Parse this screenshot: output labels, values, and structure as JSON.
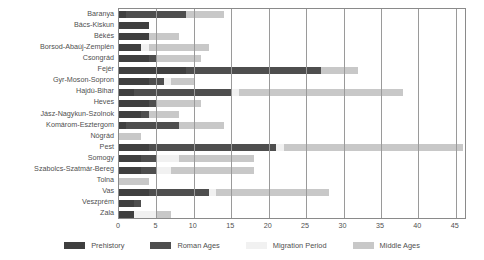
{
  "chart_data": {
    "type": "bar",
    "subtype": "stacked-horizontal-bar",
    "title": "",
    "xlabel": "",
    "ylabel": "",
    "xlim": [
      0,
      46.5
    ],
    "ylim": null,
    "grid": true,
    "grid_axis": "x",
    "legend_position": "bottom",
    "xticks": [
      0,
      5,
      10,
      15,
      20,
      25,
      30,
      35,
      40,
      45
    ],
    "categories": [
      "Baranya",
      "Bács-Kiskun",
      "Békés",
      "Borsod-Abaúj-Zemplén",
      "Csongrád",
      "Fejér",
      "Gyr-Moson-Sopron",
      "Hajdú-Bihar",
      "Heves",
      "Jász-Nagykun-Szolnok",
      "Komárom-Esztergom",
      "Nógrád",
      "Pest",
      "Somogy",
      "Szabolcs-Szatmár-Bereg",
      "Tolna",
      "Vas",
      "Veszprém",
      "Zala"
    ],
    "series": [
      {
        "name": "Prehistory",
        "color": "#3f3f3f",
        "values": [
          1,
          4,
          4,
          3,
          4,
          9,
          4,
          2,
          4,
          3,
          1,
          0,
          4,
          3,
          3,
          0,
          4,
          2,
          2
        ]
      },
      {
        "name": "Roman Ages",
        "color": "#4e4e4e",
        "values": [
          8,
          0,
          0,
          0,
          1,
          18,
          2,
          13,
          1,
          1,
          7,
          0,
          17,
          2,
          2,
          0,
          8,
          1,
          0
        ]
      },
      {
        "name": "Migration Period",
        "color": "#f1f1f1",
        "values": [
          0,
          0,
          0,
          1,
          0,
          0,
          1,
          1,
          0,
          0,
          0,
          0,
          1,
          3,
          2,
          0,
          1,
          0,
          3
        ]
      },
      {
        "name": "Middle Ages",
        "color": "#c8c8c8",
        "values": [
          5,
          0,
          4,
          8,
          6,
          5,
          3,
          22,
          6,
          4,
          6,
          3,
          24,
          10,
          11,
          4,
          15,
          0,
          2
        ]
      }
    ],
    "totals": [
      14,
      4,
      8,
      12,
      11,
      32,
      10,
      38,
      11,
      8,
      14,
      3,
      46,
      18,
      18,
      4,
      28,
      3,
      7
    ]
  },
  "legend": {
    "items": [
      {
        "label": "Prehistory",
        "color": "#3f3f3f"
      },
      {
        "label": "Roman Ages",
        "color": "#4e4e4e"
      },
      {
        "label": "Migration Period",
        "color": "#f1f1f1"
      },
      {
        "label": "Middle Ages",
        "color": "#c8c8c8"
      }
    ]
  },
  "colors": {
    "grid": "#9a9a9a",
    "frame": "#8a8a8a",
    "text": "#4f4f4f",
    "background": "#ffffff"
  }
}
